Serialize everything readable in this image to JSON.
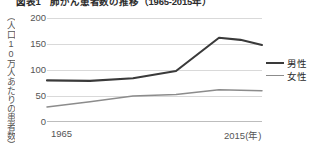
{
  "chart_data": {
    "type": "line",
    "title": "図表1　肺がん患者数の推移（1965-2015年）",
    "xlabel": "",
    "ylabel": "（人口10万人あたりの患者数）",
    "x": [
      1965,
      1975,
      1985,
      1995,
      2005,
      2010,
      2015
    ],
    "x_tick_labels": [
      "1965",
      "2015(年)"
    ],
    "y_tick_labels": [
      "0",
      "50",
      "100",
      "150",
      "200"
    ],
    "y_ticks": [
      0,
      50,
      100,
      150,
      200
    ],
    "ylim": [
      0,
      200
    ],
    "xlim": [
      1965,
      2015
    ],
    "grid": true,
    "legend_position": "right",
    "series": [
      {
        "name": "男性",
        "color": "#3a3a3a",
        "values": [
          80,
          79,
          84,
          98,
          162,
          158,
          148
        ]
      },
      {
        "name": "女性",
        "color": "#8c8c8c",
        "values": [
          29,
          39,
          50,
          53,
          62,
          61,
          60
        ]
      }
    ]
  },
  "axes": {
    "y_label_text": "（人口10万人あたりの患者数）",
    "ticks_y": [
      {
        "label": "200",
        "value": 200
      },
      {
        "label": "150",
        "value": 150
      },
      {
        "label": "100",
        "value": 100
      },
      {
        "label": "50",
        "value": 50
      },
      {
        "label": "0",
        "value": 0
      }
    ],
    "ticks_x": [
      {
        "label": "1965",
        "value": 1965
      },
      {
        "label": "2015(年)",
        "value": 2015
      }
    ]
  },
  "legend": {
    "items": [
      {
        "label": "男性",
        "color": "#3a3a3a"
      },
      {
        "label": "女性",
        "color": "#8c8c8c"
      }
    ]
  },
  "colors": {
    "male": "#3a3a3a",
    "female": "#8c8c8c",
    "grid": "#d9d9d9",
    "axis": "#bdbdbd",
    "text": "#555555",
    "background": "#ffffff"
  }
}
